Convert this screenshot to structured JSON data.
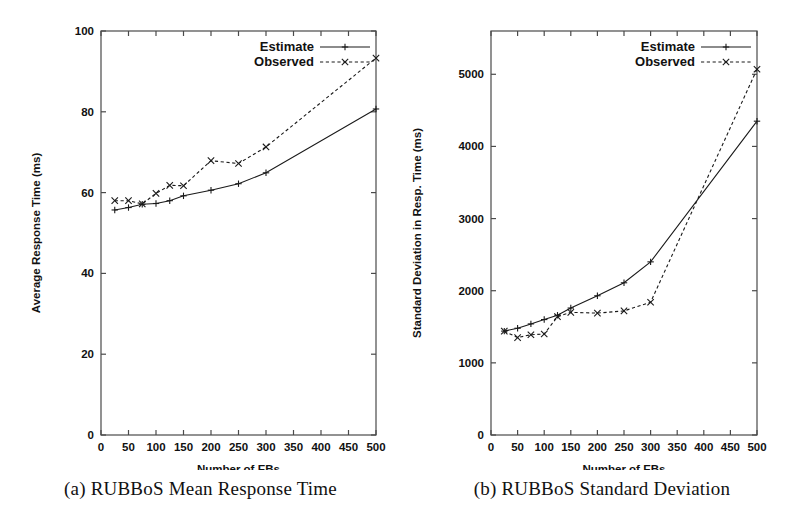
{
  "figure": {
    "panels": [
      {
        "id": "panel-a",
        "caption": "(a) RUBBoS Mean Response Time"
      },
      {
        "id": "panel-b",
        "caption": "(b) RUBBoS Standard Deviation"
      }
    ]
  },
  "chart_data": [
    {
      "type": "line",
      "title": "(a) RUBBoS Mean Response Time",
      "xlabel": "Number of EBs",
      "ylabel": "Average Response Time (ms)",
      "xlim": [
        0,
        500
      ],
      "ylim": [
        0,
        100
      ],
      "xticks": [
        0,
        50,
        100,
        150,
        200,
        250,
        300,
        350,
        400,
        450,
        500
      ],
      "xtick_labels": [
        "0",
        "50",
        "100",
        "150",
        "200",
        "250",
        "300",
        "350",
        "400",
        "450",
        "500"
      ],
      "yticks": [
        0,
        20,
        40,
        60,
        80,
        100
      ],
      "ytick_labels": [
        "0",
        "20",
        "40",
        "60",
        "80",
        "100"
      ],
      "grid": false,
      "legend_position": "top-right",
      "series": [
        {
          "name": "Estimate",
          "style": "solid",
          "marker": "plus",
          "x": [
            25,
            50,
            75,
            100,
            125,
            150,
            200,
            250,
            300,
            500
          ],
          "values": [
            55.7,
            56.3,
            57.1,
            57.3,
            58.0,
            59.2,
            60.6,
            62.2,
            64.9,
            80.7
          ]
        },
        {
          "name": "Observed",
          "style": "dashed",
          "marker": "cross",
          "x": [
            25,
            50,
            75,
            100,
            125,
            150,
            200,
            250,
            300,
            500
          ],
          "values": [
            58.0,
            58.0,
            57.2,
            59.8,
            61.8,
            61.7,
            67.9,
            67.2,
            71.3,
            93.3
          ]
        }
      ]
    },
    {
      "type": "line",
      "title": "(b) RUBBoS Standard Deviation",
      "xlabel": "Number of EBs",
      "ylabel": "Standard Deviation in Resp. Time (ms)",
      "xlim": [
        0,
        500
      ],
      "ylim": [
        0,
        5600
      ],
      "xticks": [
        0,
        50,
        100,
        150,
        200,
        250,
        300,
        350,
        400,
        450,
        500
      ],
      "xtick_labels": [
        "0",
        "50",
        "100",
        "150",
        "200",
        "250",
        "300",
        "350",
        "400",
        "450",
        "500"
      ],
      "yticks": [
        0,
        1000,
        2000,
        3000,
        4000,
        5000
      ],
      "ytick_labels": [
        "0",
        "1000",
        "2000",
        "3000",
        "4000",
        "5000"
      ],
      "grid": false,
      "legend_position": "top-right",
      "series": [
        {
          "name": "Estimate",
          "style": "solid",
          "marker": "plus",
          "x": [
            25,
            50,
            75,
            100,
            125,
            150,
            200,
            250,
            300,
            500
          ],
          "values": [
            1440,
            1480,
            1540,
            1600,
            1660,
            1760,
            1930,
            2110,
            2400,
            4350
          ]
        },
        {
          "name": "Observed",
          "style": "dashed",
          "marker": "cross",
          "x": [
            25,
            50,
            75,
            100,
            125,
            150,
            200,
            250,
            300,
            500
          ],
          "values": [
            1440,
            1350,
            1390,
            1400,
            1640,
            1700,
            1690,
            1720,
            1840,
            5070
          ]
        }
      ]
    }
  ],
  "legend": {
    "estimate_label": "Estimate",
    "observed_label": "Observed"
  },
  "axis_titles": {
    "x_common": "Number of EBs",
    "y_panel_a": "Average Response Time (ms)",
    "y_panel_b": "Standard Deviation in Resp. Time (ms)"
  }
}
